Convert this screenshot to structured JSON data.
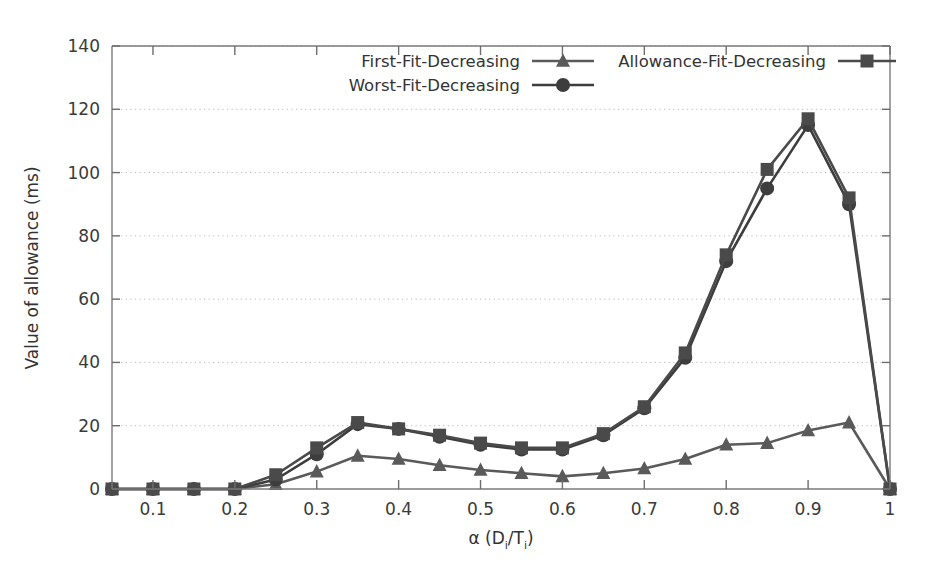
{
  "chart_data": {
    "type": "line",
    "title": "",
    "xlabel": "α (Dᵢ/Tᵢ)",
    "ylabel": "Value of allowance (ms)",
    "xlabel_parts": {
      "alpha": "α",
      "open": " (D",
      "sub1": "i",
      "slash": "/T",
      "sub2": "i",
      "close": ")"
    },
    "x": [
      0.05,
      0.1,
      0.15,
      0.2,
      0.25,
      0.3,
      0.35,
      0.4,
      0.45,
      0.5,
      0.55,
      0.6,
      0.65,
      0.7,
      0.75,
      0.8,
      0.85,
      0.9,
      0.95,
      1.0
    ],
    "xlim": [
      0.05,
      1.0
    ],
    "ylim": [
      0,
      140
    ],
    "xticks": [
      0.1,
      0.2,
      0.3,
      0.4,
      0.5,
      0.6,
      0.7,
      0.8,
      0.9,
      1.0
    ],
    "xtick_labels": [
      "0.1",
      "0.2",
      "0.3",
      "0.4",
      "0.5",
      "0.6",
      "0.7",
      "0.8",
      "0.9",
      "1"
    ],
    "yticks": [
      0,
      20,
      40,
      60,
      80,
      100,
      120,
      140
    ],
    "ytick_labels": [
      "0",
      "20",
      "40",
      "60",
      "80",
      "100",
      "120",
      "140"
    ],
    "grid": "horizontal-dotted",
    "legend_position": "top-center-inside",
    "series": [
      {
        "name": "First-Fit-Decreasing",
        "marker": "triangle",
        "color": "#5a5a5a",
        "values": [
          0,
          0,
          0,
          0,
          1.5,
          5.5,
          10.5,
          9.5,
          7.5,
          6,
          5,
          4,
          5,
          6.5,
          9.5,
          14,
          14.5,
          18.5,
          21,
          0
        ]
      },
      {
        "name": "Worst-Fit-Decreasing",
        "marker": "circle",
        "color": "#3d3d3d",
        "values": [
          0,
          0,
          0,
          0,
          3,
          11,
          20.5,
          19,
          16.5,
          14,
          12.5,
          12.5,
          17,
          25.5,
          41.5,
          72,
          95,
          115,
          90,
          0
        ]
      },
      {
        "name": "Allowance-Fit-Decreasing",
        "marker": "square",
        "color": "#4a4a4a",
        "values": [
          0,
          0,
          0,
          0,
          4.5,
          13,
          21,
          19,
          17,
          14.5,
          13,
          13,
          17.5,
          26,
          43,
          74,
          101,
          117,
          92,
          0
        ]
      }
    ]
  },
  "legend": {
    "entries": [
      {
        "label": "First-Fit-Decreasing",
        "marker": "triangle"
      },
      {
        "label": "Worst-Fit-Decreasing",
        "marker": "circle"
      },
      {
        "label": "Allowance-Fit-Decreasing",
        "marker": "square"
      }
    ]
  }
}
